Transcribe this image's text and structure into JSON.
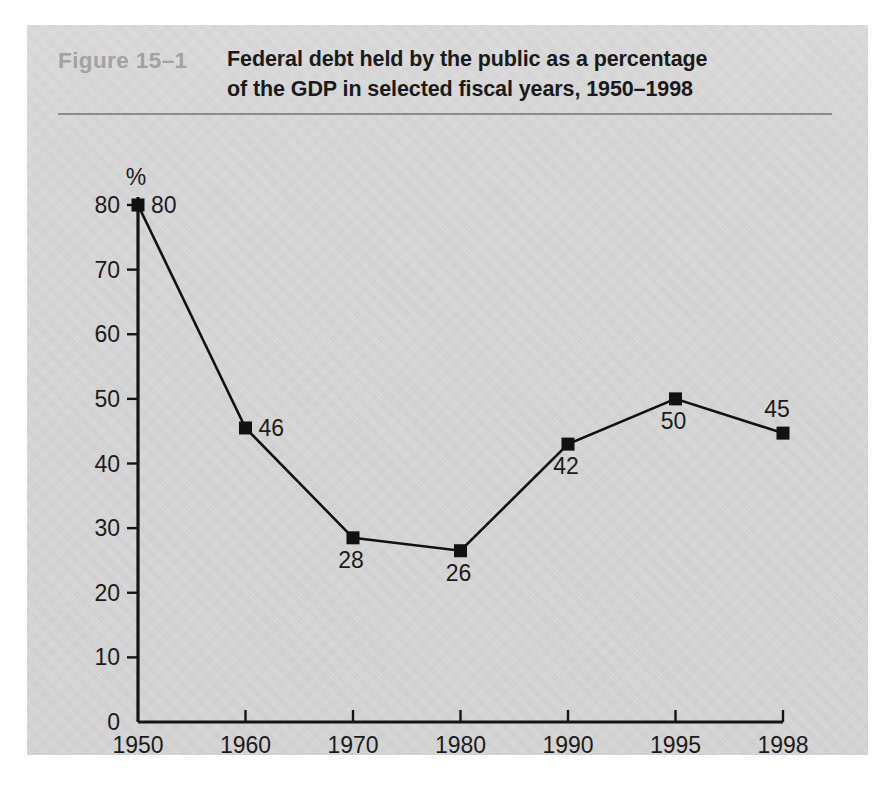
{
  "figure": {
    "number_label": "Figure  15–1",
    "title_line_1": "Federal debt held by the public as a percentage",
    "title_line_2": "of the GDP in selected fiscal years, 1950–1998",
    "panel_color": "#d2d2d2",
    "rule_color": "#8c8c8c",
    "number_color": "#a2a2a2",
    "ink_color": "#111111"
  },
  "chart_data": {
    "type": "line",
    "title": "Federal debt held by the public as a percentage of the GDP in selected fiscal years, 1950–1998",
    "xlabel": "",
    "ylabel": "%",
    "unit_label": "%",
    "categories": [
      "1950",
      "1960",
      "1970",
      "1980",
      "1990",
      "1995",
      "1998"
    ],
    "values": [
      80,
      46,
      28,
      26,
      42,
      50,
      45
    ],
    "plotted_values": [
      80,
      45.5,
      28.5,
      26.5,
      43,
      50,
      44.7
    ],
    "point_labels": [
      "80",
      "46",
      "28",
      "26",
      "42",
      "50",
      "45"
    ],
    "ylim": [
      0,
      80
    ],
    "yticks": [
      0,
      10,
      20,
      30,
      40,
      50,
      60,
      70,
      80
    ],
    "ytick_labels": [
      "0",
      "10",
      "20",
      "30",
      "40",
      "50",
      "60",
      "70",
      "80"
    ],
    "grid": false,
    "legend": "none",
    "marker": "square",
    "label_positions": [
      "right",
      "right",
      "below",
      "below",
      "below",
      "below",
      "above-left"
    ]
  },
  "bottom_caption": {
    "cropped_text": ""
  }
}
